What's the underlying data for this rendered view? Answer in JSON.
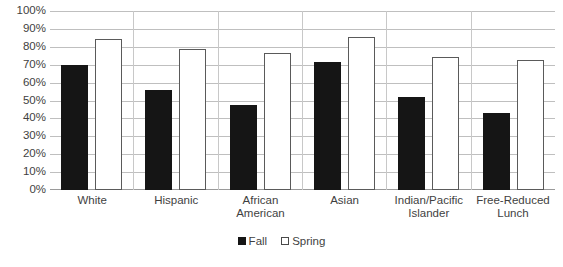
{
  "chart_data": {
    "type": "bar",
    "title": "",
    "subtitle": "",
    "xlabel": "",
    "ylabel": "",
    "ylim": [
      0,
      100
    ],
    "y_tick_labels": [
      "100%",
      "90%",
      "80%",
      "70%",
      "60%",
      "50%",
      "40%",
      "30%",
      "20%",
      "10%",
      "0%"
    ],
    "y_ticks": [
      100,
      90,
      80,
      70,
      60,
      50,
      40,
      30,
      20,
      10,
      0
    ],
    "grid": true,
    "legend_position": "bottom-center",
    "categories": [
      "White",
      "Hispanic",
      "African\nAmerican",
      "Asian",
      "Indian/Pacific\nIslander",
      "Free-Reduced\nLunch"
    ],
    "series": [
      {
        "name": "Fall",
        "color": "#151515",
        "values": [
          70,
          56,
          48,
          72,
          52,
          43
        ]
      },
      {
        "name": "Spring",
        "color": "#ffffff",
        "border_color": "#5a5a5a",
        "values": [
          85,
          79,
          77,
          86,
          75,
          73
        ]
      }
    ]
  },
  "legend": {
    "items": [
      {
        "label": "Fall"
      },
      {
        "label": "Spring"
      }
    ]
  },
  "colors": {
    "fall": "#151515",
    "spring": "#ffffff",
    "gridline": "#bfbfbf",
    "text": "#3f3f3f",
    "background": "#ffffff"
  }
}
